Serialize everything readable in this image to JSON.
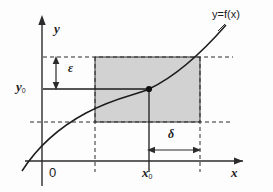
{
  "figure": {
    "kind": "epsilon-delta-continuity-diagram",
    "background": "#fdfdfd",
    "ink": "#2b2b2b",
    "shade_fill": "#d2d2d2",
    "shade_stroke": "#333333"
  },
  "labels": {
    "function_label": "y=f(x)",
    "y_axis": "y",
    "x_axis": "x",
    "origin": "0",
    "y0_main": "y",
    "y0_sub": "0",
    "x0_main": "x",
    "x0_sub": "0",
    "epsilon": "ε",
    "delta": "δ"
  },
  "chart_data": {
    "type": "line",
    "title": "",
    "xlabel": "x",
    "ylabel": "y",
    "series": [
      {
        "name": "y=f(x)",
        "description": "increasing concave-then-convex curve passing through (x0,y0)"
      }
    ],
    "annotations": [
      {
        "name": "point",
        "label": "(x0, y0)",
        "x": 149,
        "y": 89
      },
      {
        "name": "epsilon-band",
        "label": "ε",
        "y_top": 57,
        "y_bottom": 122,
        "y_center": 89
      },
      {
        "name": "delta-band",
        "label": "δ",
        "x_left": 95,
        "x_right": 200,
        "x_center": 149
      }
    ],
    "grid": false,
    "legend": "none"
  },
  "geometry": {
    "x_axis_y": 161,
    "y_axis_x": 42,
    "rect": {
      "x": 95,
      "y": 57,
      "w": 105,
      "h": 65
    },
    "x0": 149,
    "y0": 89,
    "eps_top": 57,
    "eps_bottom": 122,
    "dash_right_end": 233,
    "curve_path": "M 22,171 C 38,146 58,128 86,113 C 116,97 136,95 149,89 C 168,80 192,64 226,25"
  }
}
